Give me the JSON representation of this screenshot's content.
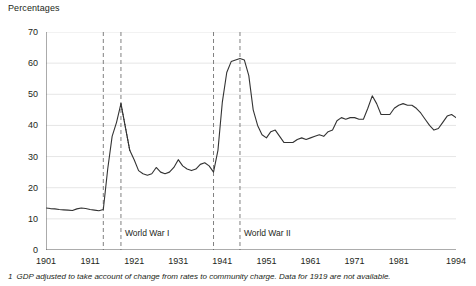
{
  "chart_data": {
    "type": "line",
    "title": "Percentages",
    "xlabel": "",
    "ylabel": "Percentages",
    "ylim": [
      0,
      70
    ],
    "xlim": [
      1901,
      1994
    ],
    "ytick_labels": [
      "0",
      "10",
      "20",
      "30",
      "40",
      "50",
      "60",
      "70"
    ],
    "yticks": [
      0,
      10,
      20,
      30,
      40,
      50,
      60,
      70
    ],
    "xtick_labels": [
      "1901",
      "1911",
      "1921",
      "1931",
      "1941",
      "1951",
      "1961",
      "1971",
      "1981",
      "1994"
    ],
    "xticks": [
      1901,
      1911,
      1921,
      1931,
      1941,
      1951,
      1961,
      1971,
      1981,
      1994
    ],
    "grid": "horizontal",
    "legend": "none",
    "x": [
      1901,
      1902,
      1903,
      1904,
      1905,
      1906,
      1907,
      1908,
      1909,
      1910,
      1911,
      1912,
      1913,
      1914,
      1915,
      1916,
      1917,
      1918,
      1920,
      1921,
      1922,
      1923,
      1924,
      1925,
      1926,
      1927,
      1928,
      1929,
      1930,
      1931,
      1932,
      1933,
      1934,
      1935,
      1936,
      1937,
      1938,
      1939,
      1940,
      1941,
      1942,
      1943,
      1944,
      1945,
      1946,
      1947,
      1948,
      1949,
      1950,
      1951,
      1952,
      1953,
      1954,
      1955,
      1956,
      1957,
      1958,
      1959,
      1960,
      1961,
      1962,
      1963,
      1964,
      1965,
      1966,
      1967,
      1968,
      1969,
      1970,
      1971,
      1972,
      1973,
      1974,
      1975,
      1976,
      1977,
      1978,
      1979,
      1980,
      1981,
      1982,
      1983,
      1984,
      1985,
      1986,
      1987,
      1988,
      1989,
      1990,
      1991,
      1992,
      1993,
      1994
    ],
    "values": [
      13.5,
      13.3,
      13.2,
      13.0,
      12.9,
      12.8,
      12.7,
      13.2,
      13.5,
      13.3,
      13.0,
      12.8,
      12.6,
      13.0,
      26.0,
      36.5,
      41.0,
      47.0,
      32.0,
      29.0,
      25.5,
      24.5,
      24.0,
      24.5,
      26.5,
      25.0,
      24.5,
      25.0,
      26.5,
      29.0,
      27.0,
      26.0,
      25.5,
      26.0,
      27.5,
      28.0,
      27.0,
      25.0,
      32.0,
      47.5,
      57.0,
      60.5,
      61.0,
      61.5,
      61.0,
      56.0,
      45.0,
      40.0,
      37.0,
      36.0,
      38.0,
      38.5,
      36.5,
      34.5,
      34.5,
      34.5,
      35.5,
      36.0,
      35.5,
      36.0,
      36.5,
      37.0,
      36.5,
      38.0,
      38.5,
      41.5,
      42.5,
      42.0,
      42.5,
      42.5,
      42.0,
      42.0,
      45.5,
      49.5,
      47.0,
      43.5,
      43.5,
      43.5,
      45.5,
      46.5,
      47.0,
      46.5,
      46.5,
      45.5,
      44.0,
      42.0,
      40.0,
      38.5,
      39.0,
      41.0,
      43.0,
      43.5,
      42.5
    ],
    "series_note": "General government expenditure as a percentage of GDP, United Kingdom, 1901 to 1994",
    "gap_segment": {
      "style": "dotted",
      "note": "Data for 1919 are not available",
      "x": [
        1918,
        1920
      ],
      "values": [
        47.0,
        32.0
      ]
    },
    "annotations": [
      {
        "label": "World War I",
        "start": 1914,
        "end": 1918,
        "line_style": "dashed"
      },
      {
        "label": "World War II",
        "start": 1939,
        "end": 1945,
        "line_style": "dashed"
      }
    ],
    "footnote": "GDP adjusted to take account of change from rates to community charge. Data for 1919 are not available.",
    "footnote_marker": "1",
    "colors": {
      "line": "#333333",
      "grid": "#e6e6e6",
      "axis": "#595959",
      "annotation": "#808080",
      "text": "#231f20",
      "background": "#ffffff"
    }
  }
}
